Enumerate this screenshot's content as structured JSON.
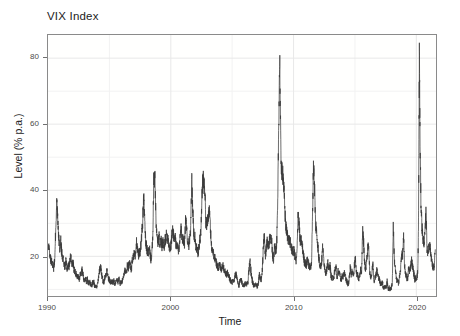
{
  "chart_data": {
    "type": "line",
    "title": "VIX Index",
    "xlabel": "Time",
    "ylabel": "Level (% p.a.)",
    "xlim": [
      1990.0,
      2021.6
    ],
    "ylim": [
      8.0,
      87.0
    ],
    "grid": true,
    "legend": null,
    "line_color": "#3a3a3a",
    "panel_color": "#fffffe",
    "grid_color": "#e8e8e8",
    "grid_minor_color": "#f2f2f2",
    "border_color": "#8a8a8a",
    "text_color": "#222222",
    "tick_color": "#4a4a4a",
    "y_ticks": [
      20,
      40,
      60,
      80
    ],
    "y_ticks_minor": [
      10,
      30,
      50,
      70
    ],
    "x_ticks": [
      1990,
      2000,
      2010,
      2020
    ],
    "x_ticks_minor": [
      1995,
      2005,
      2015
    ],
    "series_name": "VIX",
    "annotations": [
      {
        "label": "Gulf War spike",
        "x": 1990.7,
        "y": 36
      },
      {
        "label": "Asian / LTCM crisis",
        "x": 1998.7,
        "y": 45
      },
      {
        "label": "Dot-com bear market",
        "x": 2002.6,
        "y": 45
      },
      {
        "label": "Global Financial Crisis peak",
        "x": 2008.8,
        "y": 80.1
      },
      {
        "label": "Euro debt crisis",
        "x": 2011.6,
        "y": 48
      },
      {
        "label": "COVID-19 peak",
        "x": 2020.2,
        "y": 82.7
      }
    ],
    "x": [
      1990.04,
      1990.12,
      1990.21,
      1990.29,
      1990.37,
      1990.46,
      1990.54,
      1990.62,
      1990.71,
      1990.79,
      1990.87,
      1990.96,
      1991.04,
      1991.12,
      1991.21,
      1991.29,
      1991.37,
      1991.46,
      1991.54,
      1991.62,
      1991.71,
      1991.79,
      1991.87,
      1991.96,
      1992.04,
      1992.12,
      1992.21,
      1992.29,
      1992.37,
      1992.46,
      1992.54,
      1992.62,
      1992.71,
      1992.79,
      1992.87,
      1992.96,
      1993.04,
      1993.12,
      1993.21,
      1993.29,
      1993.37,
      1993.46,
      1993.54,
      1993.62,
      1993.71,
      1993.79,
      1993.87,
      1993.96,
      1994.04,
      1994.12,
      1994.21,
      1994.29,
      1994.37,
      1994.46,
      1994.54,
      1994.62,
      1994.71,
      1994.79,
      1994.87,
      1994.96,
      1995.04,
      1995.12,
      1995.21,
      1995.29,
      1995.37,
      1995.46,
      1995.54,
      1995.62,
      1995.71,
      1995.79,
      1995.87,
      1995.96,
      1996.04,
      1996.12,
      1996.21,
      1996.29,
      1996.37,
      1996.46,
      1996.54,
      1996.62,
      1996.71,
      1996.79,
      1996.87,
      1996.96,
      1997.04,
      1997.12,
      1997.21,
      1997.29,
      1997.37,
      1997.46,
      1997.54,
      1997.62,
      1997.71,
      1997.79,
      1997.87,
      1997.96,
      1998.04,
      1998.12,
      1998.21,
      1998.29,
      1998.37,
      1998.46,
      1998.54,
      1998.62,
      1998.71,
      1998.79,
      1998.87,
      1998.96,
      1999.04,
      1999.12,
      1999.21,
      1999.29,
      1999.37,
      1999.46,
      1999.54,
      1999.62,
      1999.71,
      1999.79,
      1999.87,
      1999.96,
      2000.04,
      2000.12,
      2000.21,
      2000.29,
      2000.37,
      2000.46,
      2000.54,
      2000.62,
      2000.71,
      2000.79,
      2000.87,
      2000.96,
      2001.04,
      2001.12,
      2001.21,
      2001.29,
      2001.37,
      2001.46,
      2001.54,
      2001.62,
      2001.71,
      2001.79,
      2001.87,
      2001.96,
      2002.04,
      2002.12,
      2002.21,
      2002.29,
      2002.37,
      2002.46,
      2002.54,
      2002.62,
      2002.71,
      2002.79,
      2002.87,
      2002.96,
      2003.04,
      2003.12,
      2003.21,
      2003.29,
      2003.37,
      2003.46,
      2003.54,
      2003.62,
      2003.71,
      2003.79,
      2003.87,
      2003.96,
      2004.04,
      2004.12,
      2004.21,
      2004.29,
      2004.37,
      2004.46,
      2004.54,
      2004.62,
      2004.71,
      2004.79,
      2004.87,
      2004.96,
      2005.04,
      2005.12,
      2005.21,
      2005.29,
      2005.37,
      2005.46,
      2005.54,
      2005.62,
      2005.71,
      2005.79,
      2005.87,
      2005.96,
      2006.04,
      2006.12,
      2006.21,
      2006.29,
      2006.37,
      2006.46,
      2006.54,
      2006.62,
      2006.71,
      2006.79,
      2006.87,
      2006.96,
      2007.04,
      2007.12,
      2007.21,
      2007.29,
      2007.37,
      2007.46,
      2007.54,
      2007.62,
      2007.71,
      2007.79,
      2007.87,
      2007.96,
      2008.04,
      2008.12,
      2008.21,
      2008.29,
      2008.37,
      2008.46,
      2008.54,
      2008.62,
      2008.71,
      2008.79,
      2008.87,
      2008.96,
      2009.04,
      2009.12,
      2009.21,
      2009.29,
      2009.37,
      2009.46,
      2009.54,
      2009.62,
      2009.71,
      2009.79,
      2009.87,
      2009.96,
      2010.04,
      2010.12,
      2010.21,
      2010.29,
      2010.37,
      2010.46,
      2010.54,
      2010.62,
      2010.71,
      2010.79,
      2010.87,
      2010.96,
      2011.04,
      2011.12,
      2011.21,
      2011.29,
      2011.37,
      2011.46,
      2011.54,
      2011.62,
      2011.71,
      2011.79,
      2011.87,
      2011.96,
      2012.04,
      2012.12,
      2012.21,
      2012.29,
      2012.37,
      2012.46,
      2012.54,
      2012.62,
      2012.71,
      2012.79,
      2012.87,
      2012.96,
      2013.04,
      2013.12,
      2013.21,
      2013.29,
      2013.37,
      2013.46,
      2013.54,
      2013.62,
      2013.71,
      2013.79,
      2013.87,
      2013.96,
      2014.04,
      2014.12,
      2014.21,
      2014.29,
      2014.37,
      2014.46,
      2014.54,
      2014.62,
      2014.71,
      2014.79,
      2014.87,
      2014.96,
      2015.04,
      2015.12,
      2015.21,
      2015.29,
      2015.37,
      2015.46,
      2015.54,
      2015.62,
      2015.71,
      2015.79,
      2015.87,
      2015.96,
      2016.04,
      2016.12,
      2016.21,
      2016.29,
      2016.37,
      2016.46,
      2016.54,
      2016.62,
      2016.71,
      2016.79,
      2016.87,
      2016.96,
      2017.04,
      2017.12,
      2017.21,
      2017.29,
      2017.37,
      2017.46,
      2017.54,
      2017.62,
      2017.71,
      2017.79,
      2017.87,
      2017.96,
      2018.04,
      2018.12,
      2018.21,
      2018.29,
      2018.37,
      2018.46,
      2018.54,
      2018.62,
      2018.71,
      2018.79,
      2018.87,
      2018.96,
      2019.04,
      2019.12,
      2019.21,
      2019.29,
      2019.37,
      2019.46,
      2019.54,
      2019.62,
      2019.71,
      2019.79,
      2019.87,
      2019.96,
      2020.04,
      2020.12,
      2020.17,
      2020.21,
      2020.25,
      2020.29,
      2020.37,
      2020.46,
      2020.54,
      2020.62,
      2020.71,
      2020.79,
      2020.87,
      2020.96,
      2021.04,
      2021.12,
      2021.21,
      2021.29,
      2021.37,
      2021.46,
      2021.54
    ],
    "y": [
      23.0,
      21.5,
      19.0,
      18.5,
      17.5,
      16.5,
      19.0,
      27.0,
      36.0,
      31.5,
      26.0,
      22.0,
      24.5,
      21.0,
      19.5,
      18.0,
      17.0,
      18.5,
      16.0,
      17.5,
      17.0,
      19.0,
      20.0,
      17.5,
      18.0,
      16.0,
      15.5,
      14.5,
      13.5,
      14.0,
      13.0,
      14.5,
      15.0,
      16.0,
      14.0,
      12.5,
      13.5,
      12.5,
      13.0,
      12.0,
      12.5,
      11.5,
      11.0,
      12.0,
      12.5,
      11.0,
      11.5,
      10.5,
      11.5,
      13.5,
      16.0,
      17.0,
      14.5,
      13.0,
      12.0,
      13.5,
      14.5,
      16.0,
      14.0,
      13.0,
      12.5,
      12.0,
      12.5,
      12.0,
      12.5,
      11.5,
      12.0,
      13.0,
      12.0,
      13.5,
      12.0,
      11.5,
      12.5,
      13.5,
      15.0,
      16.0,
      15.0,
      17.0,
      16.5,
      18.0,
      17.0,
      16.0,
      19.0,
      20.0,
      21.0,
      20.0,
      24.0,
      22.0,
      20.5,
      21.0,
      22.5,
      26.0,
      30.0,
      38.0,
      31.0,
      24.0,
      22.5,
      21.0,
      21.5,
      22.0,
      19.0,
      21.0,
      26.0,
      44.5,
      43.0,
      31.0,
      26.0,
      24.0,
      26.0,
      24.0,
      25.0,
      23.0,
      24.5,
      22.0,
      25.0,
      26.0,
      26.5,
      25.0,
      23.0,
      22.0,
      24.0,
      28.0,
      27.0,
      25.0,
      26.0,
      22.5,
      23.0,
      21.0,
      23.5,
      29.0,
      27.0,
      25.5,
      25.0,
      24.0,
      31.0,
      28.0,
      25.0,
      23.5,
      25.0,
      28.0,
      43.5,
      34.0,
      27.0,
      25.5,
      23.0,
      22.0,
      21.0,
      22.5,
      25.0,
      28.0,
      38.0,
      44.5,
      42.0,
      38.0,
      30.0,
      29.0,
      32.0,
      34.0,
      30.0,
      24.0,
      22.0,
      21.0,
      20.0,
      19.5,
      18.0,
      17.0,
      16.5,
      17.5,
      17.0,
      16.0,
      17.5,
      16.5,
      16.0,
      15.0,
      14.5,
      15.0,
      14.0,
      13.5,
      12.5,
      12.0,
      12.5,
      12.0,
      13.5,
      15.0,
      13.5,
      12.0,
      11.0,
      12.5,
      13.5,
      12.0,
      11.5,
      11.0,
      11.5,
      12.0,
      11.5,
      12.5,
      16.0,
      18.5,
      15.0,
      13.0,
      11.5,
      11.0,
      11.5,
      11.0,
      11.0,
      11.5,
      14.5,
      13.0,
      13.0,
      16.0,
      23.0,
      26.0,
      20.0,
      22.5,
      25.0,
      22.5,
      25.0,
      26.0,
      25.5,
      20.0,
      19.0,
      23.0,
      22.0,
      23.0,
      35.0,
      60.0,
      80.1,
      52.0,
      45.0,
      46.0,
      40.0,
      34.0,
      29.0,
      27.0,
      25.5,
      25.0,
      24.5,
      23.0,
      22.0,
      21.5,
      21.5,
      20.0,
      18.0,
      22.0,
      34.0,
      29.0,
      24.0,
      25.0,
      23.0,
      21.0,
      18.5,
      18.0,
      17.0,
      19.5,
      18.0,
      16.5,
      17.0,
      17.5,
      31.0,
      48.0,
      41.0,
      30.0,
      27.5,
      24.0,
      20.0,
      18.0,
      17.0,
      18.5,
      23.0,
      19.0,
      16.5,
      15.0,
      16.0,
      18.0,
      16.0,
      17.5,
      14.5,
      13.0,
      13.5,
      14.0,
      16.0,
      17.0,
      13.5,
      15.5,
      15.0,
      14.0,
      13.0,
      14.0,
      14.0,
      15.0,
      14.0,
      13.0,
      12.0,
      11.5,
      13.5,
      17.0,
      14.0,
      16.0,
      14.0,
      17.5,
      19.0,
      15.0,
      14.5,
      13.0,
      13.5,
      16.5,
      14.0,
      28.0,
      24.0,
      18.0,
      16.0,
      19.0,
      22.0,
      23.5,
      14.5,
      14.0,
      14.5,
      18.0,
      12.5,
      13.5,
      14.5,
      16.0,
      14.0,
      13.5,
      12.0,
      11.5,
      12.5,
      11.0,
      10.5,
      11.0,
      10.5,
      12.5,
      10.0,
      10.5,
      10.0,
      10.5,
      12.0,
      29.0,
      19.0,
      16.0,
      13.0,
      12.5,
      12.0,
      13.5,
      15.5,
      20.5,
      20.0,
      25.5,
      17.0,
      15.0,
      13.5,
      13.0,
      16.5,
      15.5,
      17.0,
      19.0,
      16.5,
      15.0,
      13.0,
      13.5,
      13.5,
      15.5,
      28.0,
      54.0,
      82.7,
      57.0,
      37.0,
      29.0,
      25.0,
      24.5,
      27.0,
      34.0,
      22.0,
      21.5,
      24.0,
      22.5,
      20.0,
      17.5,
      16.5,
      17.0,
      22.0
    ]
  }
}
